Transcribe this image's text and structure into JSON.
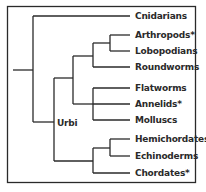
{
  "diagram": {
    "type": "phylogenetic-tree",
    "frame": {
      "left": 7,
      "top": 6,
      "right": 195,
      "bottom": 182
    },
    "line_color": "#2a2a2a",
    "leaves": [
      {
        "name": "Cnidarians",
        "y": 16
      },
      {
        "name": "Arthropods*",
        "y": 35
      },
      {
        "name": "Lobopodians",
        "y": 51
      },
      {
        "name": "Roundworms",
        "y": 67
      },
      {
        "name": "Flatworms",
        "y": 88
      },
      {
        "name": "Annelids*",
        "y": 104
      },
      {
        "name": "Molluscs",
        "y": 120
      },
      {
        "name": "Hemichordates",
        "y": 139
      },
      {
        "name": "Echinoderms",
        "y": 156
      },
      {
        "name": "Chordates*",
        "y": 173
      }
    ],
    "internal_labels": [
      {
        "name": "Urbi"
      }
    ]
  }
}
